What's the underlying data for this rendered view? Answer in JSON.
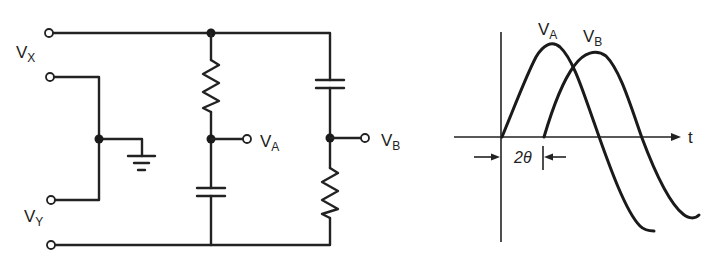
{
  "circuit": {
    "input_labels": {
      "vx": {
        "main": "V",
        "sub": "X"
      },
      "vy": {
        "main": "V",
        "sub": "Y"
      }
    },
    "output_labels": {
      "va": {
        "main": "V",
        "sub": "A"
      },
      "vb": {
        "main": "V",
        "sub": "B"
      }
    },
    "components": {
      "branch_a": [
        "resistor",
        "capacitor"
      ],
      "branch_b": [
        "capacitor",
        "resistor"
      ],
      "ground": "ground-symbol"
    }
  },
  "waveform": {
    "curve_labels": {
      "va": {
        "main": "V",
        "sub": "A"
      },
      "vb": {
        "main": "V",
        "sub": "B"
      }
    },
    "x_axis_label": "t",
    "phase_shift_label": "2θ",
    "colors": {
      "stroke": "#1a1a1a",
      "background": "#ffffff"
    }
  }
}
